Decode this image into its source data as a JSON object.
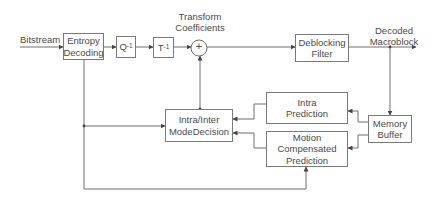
{
  "labels": {
    "input": "Bitstream",
    "transform_coeffs_line1": "Transform",
    "transform_coeffs_line2": "Coefficients",
    "output_line1": "Decoded",
    "output_line2": "Macroblock"
  },
  "blocks": {
    "entropy_line1": "Entropy",
    "entropy_line2": "Decoding",
    "inverse_quant_base": "Q",
    "inverse_quant_sup": "-1",
    "inverse_transform_base": "T",
    "inverse_transform_sup": "-1",
    "adder_symbol": "+",
    "deblocking_line1": "Deblocking",
    "deblocking_line2": "Filter",
    "memory_line1": "Memory",
    "memory_line2": "Buffer",
    "intra_line1": "Intra",
    "intra_line2": "Prediction",
    "mc_line1": "Motion",
    "mc_line2": "Compensated",
    "mc_line3": "Prediction",
    "mode_line1": "Intra/Inter",
    "mode_line2": "ModeDecision"
  },
  "colors": {
    "line": "#6e6e6e",
    "text": "#4a4a4a"
  }
}
